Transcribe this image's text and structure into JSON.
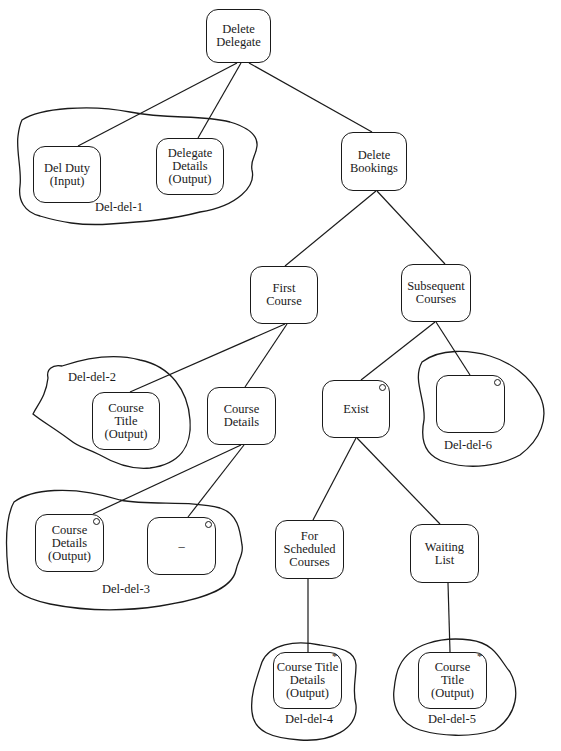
{
  "diagram": {
    "type": "structure-chart",
    "nodes": [
      {
        "id": "delete-delegate",
        "label": "Delete\nDelegate",
        "x": 206,
        "y": 9,
        "w": 65,
        "h": 54,
        "marker": ""
      },
      {
        "id": "del-duty",
        "label": "Del Duty\n(Input)",
        "x": 33,
        "y": 146,
        "w": 68,
        "h": 57,
        "marker": ""
      },
      {
        "id": "delegate-details",
        "label": "Delegate\nDetails\n(Output)",
        "x": 156,
        "y": 138,
        "w": 68,
        "h": 57,
        "marker": ""
      },
      {
        "id": "delete-bookings",
        "label": "Delete\nBookings",
        "x": 341,
        "y": 132,
        "w": 66,
        "h": 59,
        "marker": ""
      },
      {
        "id": "first-course",
        "label": "First\nCourse",
        "x": 250,
        "y": 266,
        "w": 68,
        "h": 58,
        "marker": ""
      },
      {
        "id": "subsequent-courses",
        "label": "Subsequent\nCourses",
        "x": 401,
        "y": 264,
        "w": 70,
        "h": 58,
        "marker": ""
      },
      {
        "id": "course-title-2",
        "label": "Course\nTitle\n(Output)",
        "x": 92,
        "y": 392,
        "w": 68,
        "h": 58,
        "marker": ""
      },
      {
        "id": "course-details",
        "label": "Course\nDetails",
        "x": 207,
        "y": 387,
        "w": 69,
        "h": 58,
        "marker": ""
      },
      {
        "id": "exist",
        "label": "Exist",
        "x": 322,
        "y": 380,
        "w": 68,
        "h": 58,
        "marker": "o"
      },
      {
        "id": "empty-del-6",
        "label": "",
        "x": 436,
        "y": 375,
        "w": 69,
        "h": 58,
        "marker": "o"
      },
      {
        "id": "course-details-output",
        "label": "Course\nDetails\n(Output)",
        "x": 35,
        "y": 514,
        "w": 69,
        "h": 58,
        "marker": "o"
      },
      {
        "id": "dash-node",
        "label": "–",
        "x": 147,
        "y": 517,
        "w": 69,
        "h": 58,
        "marker": "o"
      },
      {
        "id": "for-scheduled-courses",
        "label": "For\nScheduled\nCourses",
        "x": 275,
        "y": 520,
        "w": 69,
        "h": 59,
        "marker": ""
      },
      {
        "id": "waiting-list",
        "label": "Waiting\nList",
        "x": 410,
        "y": 524,
        "w": 69,
        "h": 59,
        "marker": ""
      },
      {
        "id": "course-title-details-4",
        "label": "Course Title\nDetails\n(Output)",
        "x": 273,
        "y": 652,
        "w": 69,
        "h": 57,
        "marker": "*"
      },
      {
        "id": "course-title-5",
        "label": "Course\nTitle\n(Output)",
        "x": 418,
        "y": 652,
        "w": 69,
        "h": 57,
        "marker": "*"
      }
    ],
    "edges": [
      {
        "from": [
          237,
          63
        ],
        "to": [
          78,
          146
        ]
      },
      {
        "from": [
          241,
          63
        ],
        "to": [
          198,
          138
        ]
      },
      {
        "from": [
          249,
          63
        ],
        "to": [
          372,
          132
        ]
      },
      {
        "from": [
          376,
          191
        ],
        "to": [
          285,
          266
        ]
      },
      {
        "from": [
          377,
          191
        ],
        "to": [
          445,
          264
        ]
      },
      {
        "from": [
          285,
          324
        ],
        "to": [
          130,
          392
        ]
      },
      {
        "from": [
          287,
          324
        ],
        "to": [
          245,
          387
        ]
      },
      {
        "from": [
          435,
          322
        ],
        "to": [
          361,
          380
        ]
      },
      {
        "from": [
          436,
          322
        ],
        "to": [
          470,
          375
        ]
      },
      {
        "from": [
          241,
          445
        ],
        "to": [
          93,
          514
        ]
      },
      {
        "from": [
          244,
          445
        ],
        "to": [
          188,
          517
        ]
      },
      {
        "from": [
          356,
          438
        ],
        "to": [
          313,
          520
        ]
      },
      {
        "from": [
          357,
          438
        ],
        "to": [
          440,
          524
        ]
      },
      {
        "from": [
          308,
          579
        ],
        "to": [
          308,
          652
        ]
      },
      {
        "from": [
          448,
          583
        ],
        "to": [
          450,
          652
        ]
      }
    ],
    "regions": [
      {
        "id": "del-del-1",
        "label": "Del-del-1",
        "label_x": 95,
        "label_y": 200
      },
      {
        "id": "del-del-2",
        "label": "Del-del-2",
        "label_x": 68,
        "label_y": 370
      },
      {
        "id": "del-del-3",
        "label": "Del-del-3",
        "label_x": 102,
        "label_y": 582
      },
      {
        "id": "del-del-4",
        "label": "Del-del-4",
        "label_x": 285,
        "label_y": 712
      },
      {
        "id": "del-del-5",
        "label": "Del-del-5",
        "label_x": 428,
        "label_y": 712
      },
      {
        "id": "del-del-6",
        "label": "Del-del-6",
        "label_x": 444,
        "label_y": 438
      }
    ]
  }
}
